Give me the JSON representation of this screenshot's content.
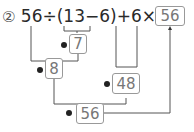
{
  "problem": {
    "number_label": "②",
    "expression": "56÷(13−6)+6×8=",
    "answer": "56"
  },
  "steps": [
    {
      "badge": "1",
      "value": "7"
    },
    {
      "badge": "2",
      "value": "8"
    },
    {
      "badge": "3",
      "value": "48"
    },
    {
      "badge": "4",
      "value": "56"
    }
  ],
  "colors": {
    "text": "#2a2a2a",
    "box_border": "#999999",
    "box_text": "#777777",
    "lines": "#555555",
    "badge": "#222222"
  }
}
